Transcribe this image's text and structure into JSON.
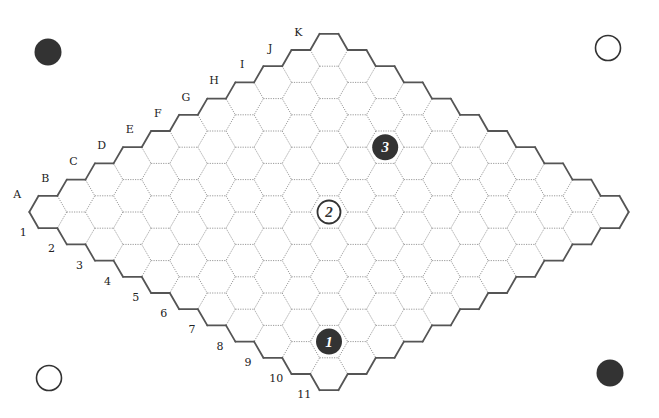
{
  "game": {
    "name": "Hex",
    "board_size": 11,
    "columns": [
      "A",
      "B",
      "C",
      "D",
      "E",
      "F",
      "G",
      "H",
      "I",
      "J",
      "K"
    ],
    "rows": [
      "1",
      "2",
      "3",
      "4",
      "5",
      "6",
      "7",
      "8",
      "9",
      "10",
      "11"
    ]
  },
  "geometry": {
    "origin_x": 48,
    "origin_y": 212,
    "step_x": 28.1,
    "step_y": 16.2,
    "hex_radius": 18.7
  },
  "colors": {
    "black_stone": "#333333",
    "white_stone": "#ffffff",
    "stone_outline": "#333333",
    "border": "#555555",
    "grid": "#9a9a9a",
    "label": "#222222"
  },
  "corner_markers": [
    {
      "position": "top-left",
      "color": "black",
      "x": 48,
      "y": 52
    },
    {
      "position": "top-right",
      "color": "white",
      "x": 608,
      "y": 48
    },
    {
      "position": "bottom-left",
      "color": "white",
      "x": 49,
      "y": 378
    },
    {
      "position": "bottom-right",
      "color": "black",
      "x": 610,
      "y": 373
    }
  ],
  "stones": [
    {
      "move": "1",
      "color": "black",
      "cell": "B10",
      "col": 1,
      "row": 9
    },
    {
      "move": "2",
      "color": "white",
      "cell": "F6",
      "col": 5,
      "row": 5
    },
    {
      "move": "3",
      "color": "black",
      "cell": "I5",
      "col": 8,
      "row": 4
    }
  ]
}
